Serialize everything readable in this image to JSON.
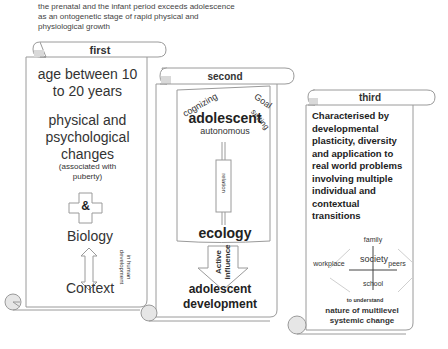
{
  "intro_text": "the prenatal and the infant period exceeds adolescence as an ontogenetic stage of rapid physical and physiological growth",
  "scrolls": [
    {
      "title": "first",
      "items": {
        "age": "age between 10 to 20 years",
        "changes": "physical and psychological changes",
        "note": "(associated with puberty)",
        "ampersand": "&",
        "biology": "Biology",
        "context": "Context",
        "side_note": "in human development"
      }
    },
    {
      "title": "second",
      "items": {
        "cognizing": "cognizing",
        "goal": "Goal",
        "setting": "setting",
        "adolescent": "adolescent",
        "autonomous": "autonomous",
        "relation": "relation",
        "ecology": "ecology",
        "active": "Active",
        "influence": "influence",
        "outcome_line1": "adolescent",
        "outcome_line2": "development"
      }
    },
    {
      "title": "third",
      "items": {
        "description": "Characterised by developmental plasticity, diversity and application to real world problems involving multiple individual and contextual transitions",
        "family": "family",
        "workplace": "workplace",
        "society": "society",
        "peers": "peers",
        "school": "school",
        "to_understand": "to understand",
        "conclusion": "nature of multilevel systemic change"
      }
    }
  ],
  "colors": {
    "stroke": "#9a9a9a",
    "curl_fill": "#d9d9d9",
    "text": "#333333"
  }
}
